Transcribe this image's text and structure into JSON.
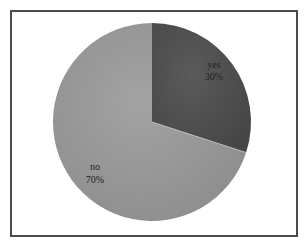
{
  "chart_data": {
    "type": "pie",
    "title": "",
    "categories": [
      "yes",
      "no"
    ],
    "values": [
      30,
      70
    ],
    "labels": [
      {
        "name": "yes",
        "percent": "30%"
      },
      {
        "name": "no",
        "percent": "70%"
      }
    ],
    "colors": {
      "yes": "#555555",
      "no": "#9a9a9a"
    },
    "start_angle_deg": 0,
    "direction": "clockwise",
    "legend": "none"
  },
  "labels": {
    "yes_name": "yes",
    "yes_percent": "30%",
    "no_name": "no",
    "no_percent": "70%"
  }
}
